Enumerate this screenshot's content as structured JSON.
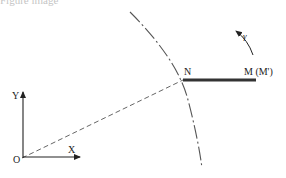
{
  "figure": {
    "caption_fragment": "Figure image",
    "axes": {
      "origin_label": "O",
      "x_label": "X",
      "y_label": "Y"
    },
    "points": {
      "n_label": "N",
      "m_label": "M (M')"
    },
    "rotation": {
      "label": "γ",
      "direction": "counter-clockwise"
    },
    "colors": {
      "line": "#222222",
      "bar": "#333333",
      "arc": "#555555",
      "dashed": "#666666"
    }
  }
}
